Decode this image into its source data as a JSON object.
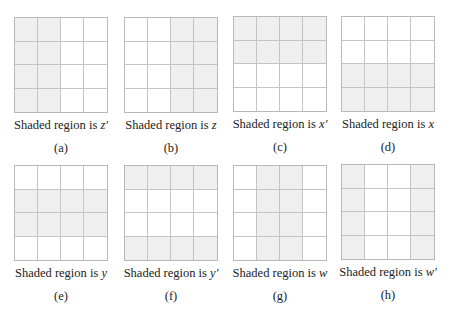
{
  "figure": {
    "shade_color": "#efefef",
    "grid_line_color": "#c4c4c4",
    "panels": [
      {
        "id": "a",
        "label": "(a)",
        "caption_prefix": "Shaded region is ",
        "variable": "z′",
        "shaded": [
          [
            1,
            1,
            0,
            0
          ],
          [
            1,
            1,
            0,
            0
          ],
          [
            1,
            1,
            0,
            0
          ],
          [
            1,
            1,
            0,
            0
          ]
        ]
      },
      {
        "id": "b",
        "label": "(b)",
        "caption_prefix": "Shaded region is ",
        "variable": "z",
        "shaded": [
          [
            0,
            0,
            1,
            1
          ],
          [
            0,
            0,
            1,
            1
          ],
          [
            0,
            0,
            1,
            1
          ],
          [
            0,
            0,
            1,
            1
          ]
        ]
      },
      {
        "id": "c",
        "label": "(c)",
        "caption_prefix": "Shaded region is ",
        "variable": "x′",
        "shaded": [
          [
            1,
            1,
            1,
            1
          ],
          [
            1,
            1,
            1,
            1
          ],
          [
            0,
            0,
            0,
            0
          ],
          [
            0,
            0,
            0,
            0
          ]
        ]
      },
      {
        "id": "d",
        "label": "(d)",
        "caption_prefix": "Shaded region is ",
        "variable": "x",
        "shaded": [
          [
            0,
            0,
            0,
            0
          ],
          [
            0,
            0,
            0,
            0
          ],
          [
            1,
            1,
            1,
            1
          ],
          [
            1,
            1,
            1,
            1
          ]
        ]
      },
      {
        "id": "e",
        "label": "(e)",
        "caption_prefix": "Shaded region is ",
        "variable": "y",
        "shaded": [
          [
            0,
            0,
            0,
            0
          ],
          [
            1,
            1,
            1,
            1
          ],
          [
            1,
            1,
            1,
            1
          ],
          [
            0,
            0,
            0,
            0
          ]
        ]
      },
      {
        "id": "f",
        "label": "(f)",
        "caption_prefix": "Shaded region is ",
        "variable": "y′",
        "shaded": [
          [
            1,
            1,
            1,
            1
          ],
          [
            0,
            0,
            0,
            0
          ],
          [
            0,
            0,
            0,
            0
          ],
          [
            1,
            1,
            1,
            1
          ]
        ]
      },
      {
        "id": "g",
        "label": "(g)",
        "caption_prefix": "Shaded region is ",
        "variable": "w",
        "shaded": [
          [
            0,
            1,
            1,
            0
          ],
          [
            0,
            1,
            1,
            0
          ],
          [
            0,
            1,
            1,
            0
          ],
          [
            0,
            1,
            1,
            0
          ]
        ]
      },
      {
        "id": "h",
        "label": "(h)",
        "caption_prefix": "Shaded region is ",
        "variable": "w′",
        "shaded": [
          [
            1,
            0,
            0,
            1
          ],
          [
            1,
            0,
            0,
            1
          ],
          [
            1,
            0,
            0,
            1
          ],
          [
            1,
            0,
            0,
            1
          ]
        ]
      }
    ]
  }
}
